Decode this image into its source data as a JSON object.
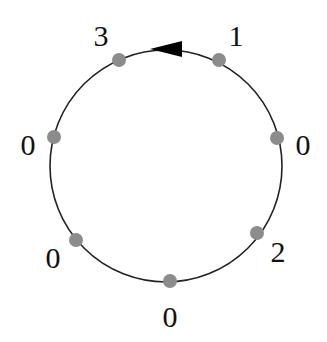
{
  "diagram": {
    "type": "circular-graph",
    "circle": {
      "cx": 166,
      "cy": 166,
      "r": 116,
      "stroke": "#222222"
    },
    "arrow": {
      "direction": "counterclockwise",
      "color": "#000000"
    },
    "node_color": "#8c8c8c",
    "nodes": [
      {
        "id": "n1",
        "label": "1",
        "x": 219,
        "y": 60,
        "lx": 236,
        "ly": 46
      },
      {
        "id": "n2",
        "label": "0",
        "x": 277,
        "y": 138,
        "lx": 303,
        "ly": 155
      },
      {
        "id": "n3",
        "label": "2",
        "x": 257,
        "y": 233,
        "lx": 278,
        "ly": 262
      },
      {
        "id": "n4",
        "label": "0",
        "x": 170,
        "y": 281,
        "lx": 170,
        "ly": 327
      },
      {
        "id": "n5",
        "label": "0",
        "x": 76,
        "y": 240,
        "lx": 53,
        "ly": 268
      },
      {
        "id": "n6",
        "label": "0",
        "x": 54,
        "y": 137,
        "lx": 28,
        "ly": 155
      },
      {
        "id": "n7",
        "label": "3",
        "x": 119,
        "y": 60,
        "lx": 101,
        "ly": 46
      }
    ]
  }
}
